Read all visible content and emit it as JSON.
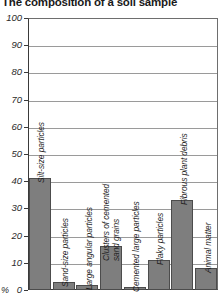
{
  "chart_data": {
    "type": "bar",
    "title": "The composition of a soil sample",
    "xlabel": "",
    "ylabel": "%",
    "ylim": [
      0,
      100
    ],
    "yticks": [
      0,
      10,
      20,
      30,
      40,
      50,
      60,
      70,
      80,
      90,
      100
    ],
    "grid": true,
    "legend": "none",
    "orientation": "vertical",
    "categories": [
      "Silt-size particles",
      "Sand-size particles",
      "Large angular particles",
      "Clusters of cemented\nsand grains",
      "Cemented large particles",
      "Flaky particles",
      "Fibrous plant debris",
      "Animal matter"
    ],
    "values": [
      41,
      3,
      2,
      16,
      1,
      11,
      33,
      8
    ],
    "bar_color": "#7e7e7e",
    "bar_edge_color": "#4c4c4c"
  },
  "axis": {
    "unit_label": "%",
    "tick_labels": [
      "0",
      "10",
      "20",
      "30",
      "40",
      "50",
      "60",
      "70",
      "80",
      "90",
      "100"
    ]
  }
}
